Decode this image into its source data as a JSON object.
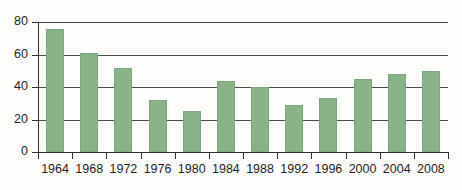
{
  "chart_data": {
    "type": "bar",
    "title": "",
    "xlabel": "",
    "ylabel": "",
    "categories": [
      "1964",
      "1968",
      "1972",
      "1976",
      "1980",
      "1984",
      "1988",
      "1992",
      "1996",
      "2000",
      "2004",
      "2008"
    ],
    "values": [
      76,
      61,
      52,
      32,
      25,
      44,
      40,
      29,
      33,
      45,
      48,
      50
    ],
    "ylim": [
      0,
      80
    ],
    "ytick_labels": [
      "0",
      "20",
      "40",
      "60",
      "80"
    ],
    "ytick_values": [
      0,
      20,
      40,
      60,
      80
    ],
    "grid": "horizontal",
    "legend": "none",
    "bar_color": "#87b387",
    "axis_color": "#2e2e2e",
    "background_color": "#fdfdfc"
  }
}
